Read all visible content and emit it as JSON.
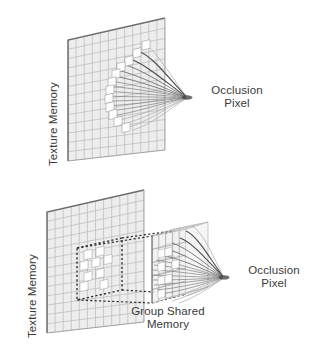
{
  "figure": {
    "type": "diagram",
    "panels": [
      {
        "id": "top",
        "name": "direct-texture-fetch",
        "labels": {
          "texture_memory": "Texture Memory",
          "occlusion_pixel": "Occlusion\nPixel",
          "occlusion_pixel_line1": "Occlusion",
          "occlusion_pixel_line2": "Pixel"
        }
      },
      {
        "id": "bottom",
        "name": "group-shared-memory-cache",
        "labels": {
          "texture_memory": "Texture Memory",
          "group_shared_memory_line1": "Group Shared",
          "group_shared_memory_line2": "Memory",
          "occlusion_pixel_line1": "Occlusion",
          "occlusion_pixel_line2": "Pixel"
        }
      }
    ]
  },
  "colors": {
    "background": "#ffffff",
    "grid_line": "#b9b9b9",
    "grid_fill": "#ededed",
    "grid_edge": "#6d6d6d",
    "ray": "#8a8a8a",
    "ray_dark": "#3c3c3c",
    "dashed": "#2b2b2b",
    "text": "#3a3a3a",
    "texel_highlight": "#ffffff",
    "gsm_line": "#9a9a9a"
  },
  "geometry": {
    "top_panel": {
      "plane_quad": [
        [
          68,
          40
        ],
        [
          165,
          18
        ],
        [
          165,
          150
        ],
        [
          68,
          161
        ]
      ],
      "grid_cols": 12,
      "grid_rows": 13,
      "converge_point": [
        186,
        97
      ],
      "ray_count": 18
    },
    "bottom_panel": {
      "plane_quad": [
        [
          47,
          212
        ],
        [
          144,
          190
        ],
        [
          144,
          322
        ],
        [
          47,
          333
        ]
      ],
      "grid_cols": 12,
      "grid_rows": 13,
      "dashed_region_quad": [
        [
          77,
          248
        ],
        [
          122,
          238
        ],
        [
          122,
          290
        ],
        [
          77,
          300
        ]
      ],
      "gsm_front_quad": [
        [
          152,
          236
        ],
        [
          186,
          229
        ],
        [
          186,
          294
        ],
        [
          152,
          303
        ]
      ],
      "gsm_depth": [
        22,
        -7
      ],
      "converge_point": [
        223,
        277
      ],
      "ray_count": 18
    }
  }
}
